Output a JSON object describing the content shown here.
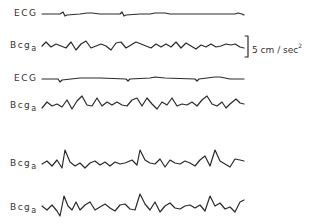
{
  "figure": {
    "traces": [
      {
        "label": "ECG",
        "sub": "",
        "y": 14
      },
      {
        "label": "Bcg",
        "sub": "a",
        "y": 44
      },
      {
        "label": "ECG",
        "sub": "",
        "y": 79
      },
      {
        "label": "Bcg",
        "sub": "a",
        "y": 104
      },
      {
        "label": "Bcg",
        "sub": "a",
        "y": 163
      },
      {
        "label": "Bcg",
        "sub": "a",
        "y": 207
      }
    ],
    "scale_bar": {
      "value": "5 cm / sec",
      "exponent": "2"
    },
    "ink_color": "#2a2a2a"
  }
}
